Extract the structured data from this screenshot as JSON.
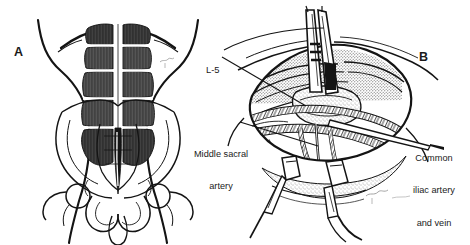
{
  "figure": {
    "background_color": "#ffffff",
    "ink_color": "#1a1a1a",
    "width": 470,
    "height": 245
  },
  "panels": [
    {
      "id": "A",
      "letter": "A",
      "caption": "Anterior view of trunk showing rectus abdominis muscles and bony pelvis",
      "region": "left"
    },
    {
      "id": "B",
      "letter": "B",
      "caption": "Operative exposure of the lumbosacral junction with retractors in place",
      "region": "right"
    }
  ],
  "annotations": {
    "l5": {
      "text": "L-5",
      "lines": [
        "L-5"
      ],
      "panel": "B"
    },
    "middle_sacral_artery": {
      "text": "Middle sacral artery",
      "lines": [
        "Middle sacral",
        "artery"
      ],
      "panel": "B"
    },
    "common_iliac": {
      "text": "Common iliac artery and vein",
      "lines": [
        "Common",
        "iliac artery",
        "and vein"
      ],
      "panel": "B"
    }
  },
  "structures": {
    "panel_a": [
      "body-outline",
      "rectus-abdominis-left",
      "rectus-abdominis-right",
      "tendinous-intersections",
      "linea-alba",
      "iliac-crest-left",
      "iliac-crest-right",
      "sacrum",
      "pubic-symphysis",
      "femoral-head-left",
      "femoral-head-right",
      "artist-signature"
    ],
    "panel_b": [
      "retractor-superior",
      "retractor-inferior-left",
      "retractor-inferior-right",
      "wound-edges",
      "l5-vertebral-body",
      "middle-sacral-artery",
      "common-iliac-artery",
      "common-iliac-vein",
      "probe-instrument",
      "artist-signature"
    ]
  }
}
